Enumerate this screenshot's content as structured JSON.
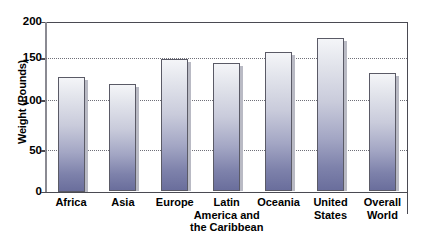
{
  "chart_data": {
    "type": "bar",
    "title": "",
    "subtitle": "",
    "xlabel": "",
    "ylabel": "Weight (Pounds)",
    "ylim": [
      0,
      200
    ],
    "yticks": [
      0,
      50,
      100,
      150,
      200
    ],
    "ytick_labels": [
      "0",
      "50",
      "100",
      "150",
      "200"
    ],
    "grid": "horizontal-dotted",
    "legend": "none",
    "categories": [
      "Africa",
      "Asia",
      "Europe",
      "Latin\nAmerica and\nthe Caribbean",
      "Oceania",
      "United\nStates",
      "Overall\nWorld"
    ],
    "values": [
      135,
      127,
      156,
      151,
      164,
      181,
      139
    ],
    "bar_fill_top_color": "#f4f5f8",
    "bar_fill_bottom_color": "#6a6e9c",
    "bar_border_color": "#5a5a66",
    "axis_color": "#4a4a52",
    "gridline_color": "#6f6f78",
    "background_color": "#ffffff"
  },
  "axis": {
    "y_title": "Weight (Pounds)"
  }
}
